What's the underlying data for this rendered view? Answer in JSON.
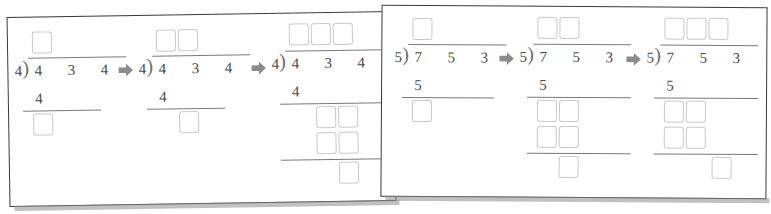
{
  "worksheet": {
    "type": "long-division-step-sequence",
    "panels": [
      {
        "id": "panel-left",
        "problem": {
          "divisor": "4",
          "dividend_digits": [
            "4",
            "3",
            "4"
          ]
        },
        "stages": [
          {
            "label": "stage-1",
            "quotient_boxes": 1,
            "partial_product": "4",
            "remainder_boxes": 1,
            "extra_rows": 0
          },
          {
            "label": "stage-2",
            "quotient_boxes": 2,
            "partial_product": "4",
            "remainder_boxes": 1,
            "extra_rows": 0
          },
          {
            "label": "stage-3",
            "quotient_boxes": 3,
            "partial_product": "4",
            "remainder_boxes": 2,
            "extra_rows": 2
          }
        ],
        "arrows": [
          "arrow-right",
          "arrow-right"
        ]
      },
      {
        "id": "panel-right",
        "problem": {
          "divisor": "5",
          "dividend_digits": [
            "7",
            "5",
            "3"
          ]
        },
        "stages": [
          {
            "label": "stage-1",
            "quotient_boxes": 1,
            "partial_product": "5",
            "remainder_boxes": 1,
            "extra_rows": 0
          },
          {
            "label": "stage-2",
            "quotient_boxes": 2,
            "partial_product": "5",
            "remainder_boxes": 2,
            "extra_rows": 2
          },
          {
            "label": "stage-3",
            "quotient_boxes": 3,
            "partial_product": "5",
            "remainder_boxes": 2,
            "extra_rows": 2
          }
        ],
        "arrows": [
          "arrow-right",
          "arrow-right"
        ]
      }
    ]
  },
  "glyphs": {
    "division_bracket": ")",
    "arrow_icon": "arrow-right-icon"
  },
  "colors": {
    "paper_border": "#3a3a3a",
    "ink": "#4a4a4a",
    "rule": "#7a7a7a",
    "box_border": "#c9c9c9",
    "arrow": "#8b8b8b",
    "paper": "#ffffff",
    "shadow": "#8d8d8d"
  },
  "left": {
    "s1": {
      "divisor": "4",
      "d0": "4",
      "d1": "3",
      "d2": "4",
      "prod": "4"
    },
    "s2": {
      "divisor": "4",
      "d0": "4",
      "d1": "3",
      "d2": "4",
      "prod": "4"
    },
    "s3": {
      "divisor": "4",
      "d0": "4",
      "d1": "3",
      "d2": "4",
      "prod": "4"
    }
  },
  "right": {
    "s1": {
      "divisor": "5",
      "d0": "7",
      "d1": "5",
      "d2": "3",
      "prod": "5"
    },
    "s2": {
      "divisor": "5",
      "d0": "7",
      "d1": "5",
      "d2": "3",
      "prod": "5"
    },
    "s3": {
      "divisor": "5",
      "d0": "7",
      "d1": "5",
      "d2": "3",
      "prod": "5"
    }
  }
}
